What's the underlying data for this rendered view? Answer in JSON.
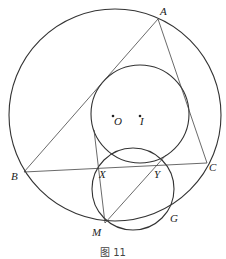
{
  "figure": {
    "caption": "图 11",
    "points": {
      "A": {
        "label": "A",
        "x": 158,
        "y": 19
      },
      "B": {
        "label": "B",
        "x": 24,
        "y": 172
      },
      "C": {
        "label": "C",
        "x": 207,
        "y": 163
      },
      "X": {
        "label": "X",
        "x": 98,
        "y": 166
      },
      "Y": {
        "label": "Y",
        "x": 160,
        "y": 162
      },
      "M": {
        "label": "M",
        "x": 105,
        "y": 223
      },
      "G": {
        "label": "G",
        "x": 171,
        "y": 212
      },
      "O": {
        "label": "O",
        "x": 113,
        "y": 116
      },
      "I": {
        "label": "I",
        "x": 140,
        "y": 116
      }
    },
    "circles": [
      {
        "name": "circumcircle",
        "cx": 115,
        "cy": 115,
        "r": 106
      },
      {
        "name": "incircle-like",
        "cx": 140,
        "cy": 114,
        "r": 49
      },
      {
        "name": "small-circle",
        "cx": 133,
        "cy": 189,
        "r": 41
      }
    ],
    "segments": [
      "AB",
      "AC",
      "BC",
      "XM",
      "MY"
    ]
  }
}
